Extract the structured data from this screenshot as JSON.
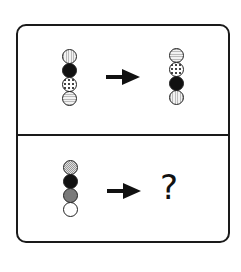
{
  "puzzle": {
    "top_row": {
      "left_stack": [
        "vertical-stripes",
        "black",
        "dots",
        "horizontal-stripes"
      ],
      "arrow": "right-arrow",
      "right_stack": [
        "horizontal-stripes",
        "dots",
        "black",
        "vertical-stripes"
      ]
    },
    "bottom_row": {
      "left_stack": [
        "light-checkered",
        "black",
        "grey",
        "white"
      ],
      "arrow": "right-arrow",
      "answer": "?"
    }
  }
}
